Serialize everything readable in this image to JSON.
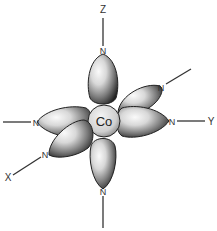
{
  "diagram": {
    "type": "octahedral-coordination",
    "center_atom": "Co",
    "ligand_atom": "N",
    "axes": {
      "z": "Z",
      "y": "Y",
      "x": "X"
    },
    "ligands": [
      {
        "position": "top",
        "label": "N"
      },
      {
        "position": "upper-right",
        "label": "N"
      },
      {
        "position": "left",
        "label": "N"
      },
      {
        "position": "right",
        "label": "N"
      },
      {
        "position": "lower-left",
        "label": "N"
      },
      {
        "position": "bottom",
        "label": "N"
      }
    ],
    "colors": {
      "line": "#333333",
      "lobe_dark": "#2a2a2a",
      "lobe_light": "#f2f2f2",
      "background": "#ffffff"
    }
  }
}
